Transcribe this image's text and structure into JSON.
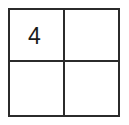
{
  "figure": {
    "type": "grid",
    "rows": 2,
    "columns": 2,
    "border_color": "#2b2b2b",
    "background_color": "#ffffff",
    "text_color": "#1c1c1c",
    "cells": [
      {
        "row": 0,
        "column": 0,
        "value": "4"
      },
      {
        "row": 0,
        "column": 1,
        "value": ""
      },
      {
        "row": 1,
        "column": 0,
        "value": ""
      },
      {
        "row": 1,
        "column": 1,
        "value": ""
      }
    ]
  }
}
